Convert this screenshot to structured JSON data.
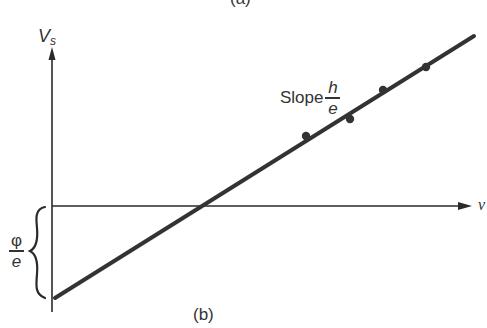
{
  "figure": {
    "caption_top": "(a)",
    "caption_bottom": "(b)"
  },
  "chart_data": {
    "type": "line",
    "title": "",
    "subtitle": "(b)",
    "xlabel": "ν",
    "ylabel": "V_s",
    "ylabel_main": "V",
    "ylabel_sub": "s",
    "grid": false,
    "legend": null,
    "axis_units": "arbitrary (diagram, no tick labels)",
    "xlim": [
      0,
      42
    ],
    "ylim": [
      -9.4,
      17
    ],
    "fit_line": {
      "description": "Straight line V_s = (h/e)ν − φ/e",
      "x_intercept": 15.0,
      "y_intercept": -9.4,
      "slope": 0.625,
      "x": [
        0.3,
        42.2
      ],
      "y": [
        -9.2,
        17.0
      ]
    },
    "series": [
      {
        "name": "measured points",
        "x": [
          25.4,
          29.8,
          33.1,
          37.4
        ],
        "y": [
          7.0,
          8.7,
          11.6,
          13.9
        ]
      }
    ],
    "annotations": [
      {
        "text": "Slope h/e",
        "prefix": "Slope",
        "numerator": "h",
        "denominator": "e",
        "position": "above line near upper points"
      },
      {
        "text": "φ/e",
        "numerator": "φ",
        "denominator": "e",
        "position": "left brace spanning from x-axis to y-intercept"
      }
    ]
  },
  "colors": {
    "background": "#ffffff",
    "ink": "#2a2a2a",
    "line": "#333333"
  }
}
